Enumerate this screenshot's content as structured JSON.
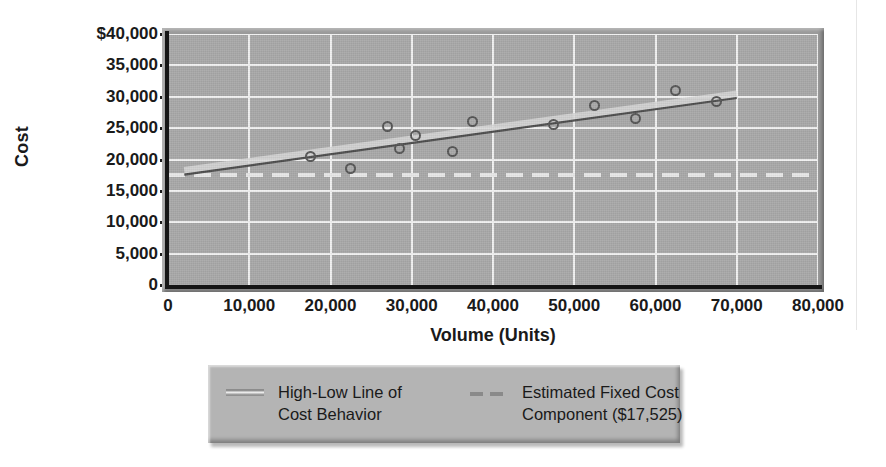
{
  "chart_data": {
    "type": "scatter",
    "title": "",
    "xlabel": "Volume (Units)",
    "ylabel": "Cost",
    "xlim": [
      0,
      80000
    ],
    "ylim": [
      0,
      40000
    ],
    "grid": true,
    "legend_position": "below-plot",
    "x_ticks": [
      0,
      10000,
      20000,
      30000,
      40000,
      50000,
      60000,
      70000,
      80000
    ],
    "x_ticklabels": [
      "0",
      "10,000",
      "20,000",
      "30,000",
      "40,000",
      "50,000",
      "60,000",
      "70,000",
      "80,000"
    ],
    "y_ticks": [
      0,
      5000,
      10000,
      15000,
      20000,
      25000,
      30000,
      35000,
      40000
    ],
    "y_ticklabels": [
      "0",
      "5,000",
      "10,000",
      "15,000",
      "20,000",
      "25,000",
      "30,000",
      "35,000",
      "$40,000"
    ],
    "series": [
      {
        "name": "Observed Cost Points",
        "type": "scatter",
        "marker": "open-circle",
        "color": "#555555",
        "points": [
          {
            "x": 17500,
            "y": 20400
          },
          {
            "x": 22500,
            "y": 18600
          },
          {
            "x": 27000,
            "y": 25200
          },
          {
            "x": 28500,
            "y": 21800
          },
          {
            "x": 30500,
            "y": 23800
          },
          {
            "x": 35000,
            "y": 21300
          },
          {
            "x": 37500,
            "y": 26000
          },
          {
            "x": 47500,
            "y": 25600
          },
          {
            "x": 52500,
            "y": 28600
          },
          {
            "x": 57500,
            "y": 26500
          },
          {
            "x": 62500,
            "y": 31000
          },
          {
            "x": 67500,
            "y": 29300
          }
        ]
      },
      {
        "name": "High-Low Line of Cost Behavior",
        "type": "line",
        "style": "solid",
        "color": "#6e6e6e",
        "points": [
          {
            "x": 2000,
            "y": 17600
          },
          {
            "x": 70000,
            "y": 29800
          }
        ]
      },
      {
        "name": "Estimated Fixed Cost Component ($17,525)",
        "type": "line",
        "style": "dashed",
        "color": "#e8e8e8",
        "value": 17525,
        "points": [
          {
            "x": 0,
            "y": 17525
          },
          {
            "x": 80000,
            "y": 17525
          }
        ]
      }
    ],
    "legend": [
      {
        "id": "high-low",
        "style": "solid",
        "line1": "High-Low Line of",
        "line2": "Cost Behavior"
      },
      {
        "id": "fixed-cost",
        "style": "dashed",
        "line1": "Estimated Fixed Cost",
        "line2": "Component ($17,525)"
      }
    ],
    "colors": {
      "plot_background": "#a9a9a9",
      "gridline": "#f2f2f2",
      "axis": "#161616",
      "legend_background": "#b4b4b4",
      "marker_edge": "#555555",
      "trend_line": "#6e6e6e",
      "fixed_line": "#e8e8e8",
      "text": "#1a1a1a"
    }
  }
}
